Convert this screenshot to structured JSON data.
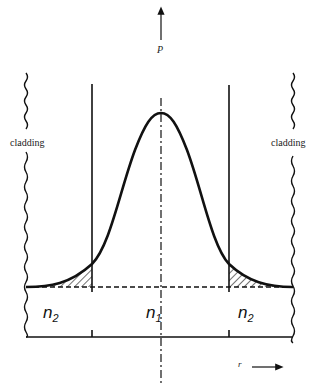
{
  "diagram": {
    "axes": {
      "vertical_label": "P",
      "horizontal_label": "r"
    },
    "regions": {
      "left_cladding_label": "cladding",
      "right_cladding_label": "cladding",
      "left_index": "n",
      "left_index_sub": "2",
      "core_index": "n",
      "core_index_sub": "1",
      "right_index": "n",
      "right_index_sub": "2"
    },
    "colors": {
      "line": "#111111",
      "background": "#ffffff"
    }
  }
}
